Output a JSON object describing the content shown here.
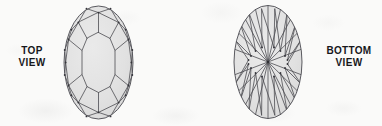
{
  "figure": {
    "background_color": "#fafaf9",
    "width": 382,
    "height": 126
  },
  "labels": {
    "top_view": {
      "line1": "TOP",
      "line2": "VIEW"
    },
    "bottom_view": {
      "line1": "BOTTOM",
      "line2": "VIEW"
    }
  },
  "colors": {
    "stone_fill": "#e2e2e2",
    "table_fill": "#e6e6e6",
    "facet_line": "#4c4c52",
    "outline": "#3f3f46",
    "label_text": "#17171c"
  },
  "diagram": {
    "views": [
      {
        "name": "top-view",
        "label": "TOP VIEW",
        "aspect": "crown",
        "outline": {
          "cx": 98.5,
          "cy": 62.5,
          "rx": 34.5,
          "ry": 56.5
        },
        "table": {
          "cx": 98.5,
          "cy": 62.5,
          "rx": 16.5,
          "ry": 30.0
        },
        "facet_rings": [
          "table",
          "star-facets",
          "bezel-kite-facets",
          "upper-girdle-facets"
        ],
        "girdle_points": 16
      },
      {
        "name": "bottom-view",
        "label": "BOTTOM VIEW",
        "aspect": "pavilion",
        "outline": {
          "cx": 268.0,
          "cy": 62.0,
          "rx": 34.0,
          "ry": 56.5
        },
        "culet": {
          "cx": 268.0,
          "cy": 62.0
        },
        "facet_rings": [
          "pavilion-main-facets",
          "lower-girdle-facets"
        ],
        "main_facets": 16,
        "girdle_points": 16
      }
    ]
  }
}
